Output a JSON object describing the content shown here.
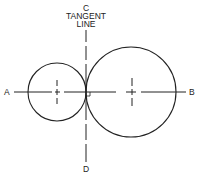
{
  "diagram": {
    "title_label_top": "C",
    "tangent_label_line1": "TANGENT",
    "tangent_label_line2": "LINE",
    "label_bottom": "D",
    "label_left": "A",
    "label_right": "B",
    "small_circle": {
      "cx": 57,
      "cy": 92,
      "r": 29
    },
    "large_circle": {
      "cx": 131,
      "cy": 92,
      "r": 45
    },
    "stroke_color": "#222222"
  }
}
